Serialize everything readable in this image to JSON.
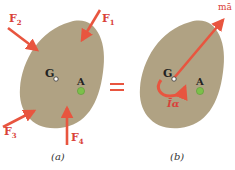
{
  "diagram": {
    "colors": {
      "body_fill": "#b0a283",
      "arrow": "#e8553f",
      "label": "#d9413a",
      "point_A": "#7cc04a",
      "text": "#222222"
    },
    "panel_a": {
      "caption": "(a)",
      "center_label": "G",
      "point_label": "A",
      "forces": [
        {
          "label": "F",
          "sub": "1"
        },
        {
          "label": "F",
          "sub": "2"
        },
        {
          "label": "F",
          "sub": "3"
        },
        {
          "label": "F",
          "sub": "4"
        }
      ]
    },
    "equals_sign": "=",
    "panel_b": {
      "caption": "(b)",
      "center_label": "G",
      "point_label": "A",
      "vector_label": "mā",
      "couple_label": "Īα"
    }
  }
}
